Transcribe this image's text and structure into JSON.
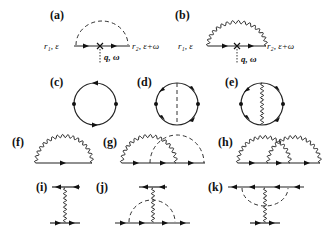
{
  "figure": {
    "panels": [
      {
        "id": "a",
        "label": "(a)",
        "left_vertex": "r₁, ε",
        "right_vertex": "r₂, ε+ω",
        "external": "q, ω",
        "propagator": "dashed"
      },
      {
        "id": "b",
        "label": "(b)",
        "left_vertex": "r₁, ε",
        "right_vertex": "r₂, ε+ω",
        "external": "q, ω",
        "propagator": "wavy"
      },
      {
        "id": "c",
        "label": "(c)",
        "type": "bubble"
      },
      {
        "id": "d",
        "label": "(d)",
        "type": "bubble-dashed-rung"
      },
      {
        "id": "e",
        "label": "(e)",
        "type": "bubble-wavy-rung"
      },
      {
        "id": "f",
        "label": "(f)",
        "type": "self-energy-wavy"
      },
      {
        "id": "g",
        "label": "(g)",
        "type": "self-energy-wavy-dashed-crossed"
      },
      {
        "id": "h",
        "label": "(h)",
        "type": "self-energy-two-wavy-crossed"
      },
      {
        "id": "i",
        "label": "(i)",
        "type": "wavy-exchange"
      },
      {
        "id": "j",
        "label": "(j)",
        "type": "wavy-exchange-dashed-lower"
      },
      {
        "id": "k",
        "label": "(k)",
        "type": "wavy-exchange-dashed-upper"
      }
    ]
  }
}
